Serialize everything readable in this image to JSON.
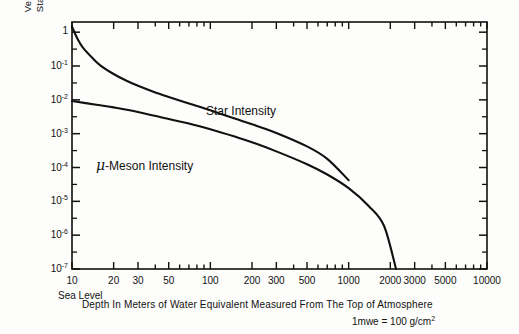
{
  "chart_data": {
    "type": "line",
    "title": "",
    "xlabel": "Depth In Meters of Water Equivalent Measured From The Top of Atmosphere",
    "ylabel_line1": "Vertical Intensity (Particles/cm2 sec ster)",
    "ylabel_line2": "Star Intensity (Stars/cm3 Day in Emulsion)",
    "xscale": "log",
    "yscale": "log",
    "xlim": [
      10,
      10000
    ],
    "ylim": [
      1e-07,
      2
    ],
    "grid": false,
    "legend_position": "inline-annotation",
    "xticks": [
      10,
      20,
      30,
      50,
      100,
      200,
      300,
      500,
      1000,
      2000,
      3000,
      5000,
      10000
    ],
    "xtick_labels": [
      "10",
      "20",
      "30",
      "50",
      "100",
      "200",
      "300",
      "500",
      "1000",
      "2000",
      "3000",
      "5000",
      "10000"
    ],
    "yticks": [
      1,
      0.1,
      0.01,
      0.001,
      0.0001,
      1e-05,
      1e-06,
      1e-07
    ],
    "ytick_labels": [
      "1",
      "10-1",
      "10-2",
      "10-3",
      "10-4",
      "10-5",
      "10-6",
      "10-7"
    ],
    "annotations": [
      {
        "text": "Sea Level",
        "x": 10,
        "position": "below-axis-left"
      },
      {
        "text": "1mwe = 100 g/cm2",
        "position": "below-caption-right"
      }
    ],
    "series": [
      {
        "name": "Star Intensity",
        "label_text": "Star Intensity",
        "x": [
          10,
          11,
          12,
          14,
          16,
          20,
          25,
          30,
          40,
          50,
          70,
          100,
          150,
          200,
          300,
          500,
          700,
          1000
        ],
        "y": [
          1.45,
          0.62,
          0.35,
          0.175,
          0.105,
          0.058,
          0.036,
          0.026,
          0.0165,
          0.0122,
          0.0078,
          0.0049,
          0.0028,
          0.0019,
          0.00105,
          0.00042,
          0.00018,
          4.2e-05
        ]
      },
      {
        "name": "mu-Meson Intensity",
        "label_text": "-Meson Intensity",
        "label_prefix_glyph": "mu",
        "x": [
          10,
          15,
          20,
          30,
          50,
          70,
          100,
          150,
          200,
          300,
          500,
          700,
          1000,
          1400,
          1800,
          2200
        ],
        "y": [
          0.0092,
          0.0072,
          0.006,
          0.0044,
          0.0027,
          0.002,
          0.00135,
          0.00082,
          0.00056,
          0.0003,
          0.000125,
          6.2e-05,
          2.45e-05,
          7.2e-06,
          1.9e-06,
          1e-07
        ]
      }
    ]
  },
  "axis": {
    "ytick_mantissa": "10",
    "ytick_one": "1"
  },
  "colors": {
    "ink": "#111111",
    "paper": "#fdfdfb"
  }
}
